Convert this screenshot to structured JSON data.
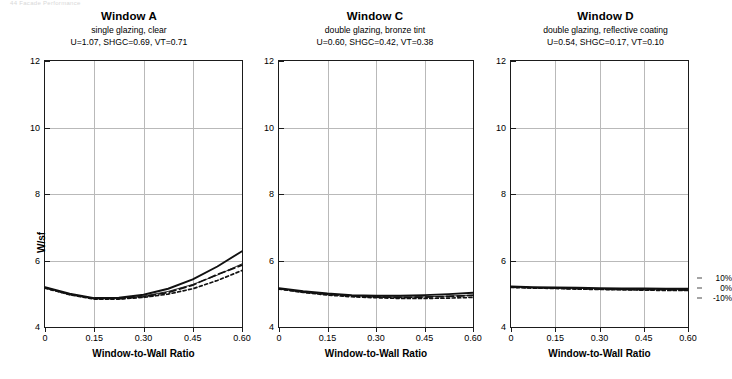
{
  "running_head": "44  Facade Performance",
  "axes": {
    "y_label": "W/sf",
    "y_ticks": [
      "4",
      "6",
      "8",
      "10",
      "12"
    ],
    "y_tick_values": [
      4,
      6,
      8,
      10,
      12
    ],
    "x_label": "Window-to-Wall Ratio",
    "x_ticks": [
      "0",
      "0.15",
      "0.30",
      "0.45",
      "0.60"
    ],
    "x_tick_values": [
      0,
      0.15,
      0.3,
      0.45,
      0.6
    ]
  },
  "legend": {
    "items": [
      {
        "label": "10%"
      },
      {
        "label": "0%"
      },
      {
        "label": "-10%"
      }
    ]
  },
  "panels": [
    {
      "title": "Window A",
      "subtitle": "single glazing, clear",
      "properties": "U=1.07, SHGC=0.69, VT=0.71"
    },
    {
      "title": "Window C",
      "subtitle": "double glazing, bronze tint",
      "properties": "U=0.60, SHGC=0.42, VT=0.38"
    },
    {
      "title": "Window D",
      "subtitle": "double glazing, reflective coating",
      "properties": "U=0.54, SHGC=0.17, VT=0.10"
    }
  ],
  "chart_data": {
    "type": "line",
    "xlabel": "Window-to-Wall Ratio",
    "ylabel": "W/sf",
    "xlim": [
      0,
      0.6
    ],
    "ylim": [
      4,
      12
    ],
    "grid": true,
    "legend_position": "right-outside",
    "x": [
      0,
      0.075,
      0.15,
      0.225,
      0.3,
      0.375,
      0.45,
      0.525,
      0.6
    ],
    "panels": [
      {
        "name": "Window A",
        "subtitle": "single glazing, clear",
        "properties": "U=1.07, SHGC=0.69, VT=0.71",
        "series": [
          {
            "name": "10%",
            "style": "solid-thick",
            "values": [
              5.2,
              5.0,
              4.87,
              4.88,
              4.97,
              5.15,
              5.43,
              5.82,
              6.28
            ]
          },
          {
            "name": "0%",
            "style": "solid-thin",
            "values": [
              5.19,
              4.99,
              4.86,
              4.86,
              4.93,
              5.07,
              5.28,
              5.56,
              5.9
            ]
          },
          {
            "name": "-10%",
            "style": "long-dash",
            "values": [
              5.18,
              4.98,
              4.85,
              4.85,
              4.91,
              5.04,
              5.26,
              5.58,
              5.86
            ]
          },
          {
            "name": "-10% alt",
            "style": "short-dash",
            "values": [
              5.17,
              4.97,
              4.84,
              4.84,
              4.89,
              4.99,
              5.15,
              5.4,
              5.7
            ]
          }
        ]
      },
      {
        "name": "Window C",
        "subtitle": "double glazing, bronze tint",
        "properties": "U=0.60, SHGC=0.42, VT=0.38",
        "series": [
          {
            "name": "10%",
            "style": "solid-thick",
            "values": [
              5.17,
              5.08,
              5.01,
              4.96,
              4.94,
              4.94,
              4.96,
              4.99,
              5.03
            ]
          },
          {
            "name": "0%",
            "style": "solid-thin",
            "values": [
              5.16,
              5.06,
              4.99,
              4.94,
              4.91,
              4.9,
              4.91,
              4.93,
              4.96
            ]
          },
          {
            "name": "-10%",
            "style": "long-dash",
            "values": [
              5.15,
              5.05,
              4.98,
              4.93,
              4.9,
              4.89,
              4.9,
              4.92,
              4.95
            ]
          },
          {
            "name": "-10% alt",
            "style": "short-dash",
            "values": [
              5.14,
              5.04,
              4.96,
              4.91,
              4.88,
              4.86,
              4.86,
              4.87,
              4.89
            ]
          }
        ]
      },
      {
        "name": "Window D",
        "subtitle": "double glazing, reflective coating",
        "properties": "U=0.54, SHGC=0.17, VT=0.10",
        "series": [
          {
            "name": "10%",
            "style": "solid-thick",
            "values": [
              5.22,
              5.2,
              5.19,
              5.18,
              5.17,
              5.16,
              5.16,
              5.15,
              5.15
            ]
          },
          {
            "name": "0%",
            "style": "solid-thin",
            "values": [
              5.21,
              5.19,
              5.18,
              5.16,
              5.15,
              5.14,
              5.14,
              5.13,
              5.13
            ]
          },
          {
            "name": "-10%",
            "style": "long-dash",
            "values": [
              5.2,
              5.18,
              5.17,
              5.15,
              5.14,
              5.13,
              5.12,
              5.12,
              5.11
            ]
          },
          {
            "name": "-10% alt",
            "style": "short-dash",
            "values": [
              5.19,
              5.17,
              5.16,
              5.14,
              5.13,
              5.12,
              5.11,
              5.1,
              5.1
            ]
          }
        ]
      }
    ]
  }
}
